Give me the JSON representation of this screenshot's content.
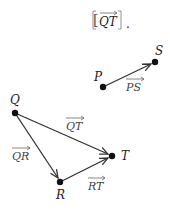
{
  "header": {
    "expression": "QT",
    "open_bracket": "[",
    "close_bracket": "]",
    "trailing": "."
  },
  "points": {
    "P": {
      "label": "P",
      "x": 103,
      "y": 87
    },
    "S": {
      "label": "S",
      "x": 155,
      "y": 62
    },
    "Q": {
      "label": "Q",
      "x": 15,
      "y": 113
    },
    "R": {
      "label": "R",
      "x": 60,
      "y": 182
    },
    "T": {
      "label": "T",
      "x": 112,
      "y": 156
    }
  },
  "vectors": {
    "PS": {
      "label": "PS"
    },
    "QT": {
      "label": "QT"
    },
    "QR": {
      "label": "QR"
    },
    "RT": {
      "label": "RT"
    }
  },
  "colors": {
    "line": "#333333",
    "point": "#111111",
    "text": "#222222"
  }
}
